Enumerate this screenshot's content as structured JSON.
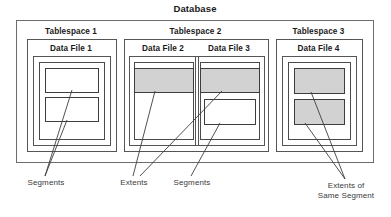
{
  "diagram": {
    "title": "Database",
    "tablespaces": [
      {
        "label": "Tablespace 1",
        "datafiles": [
          {
            "label": "Data File 1",
            "blocks": [
              {
                "fill": "white"
              },
              {
                "fill": "white"
              }
            ]
          }
        ]
      },
      {
        "label": "Tablespace 2",
        "datafiles": [
          {
            "label": "Data File 2",
            "blocks": [
              {
                "fill": "gray"
              }
            ]
          },
          {
            "label": "Data File 3",
            "blocks": [
              {
                "fill": "gray"
              },
              {
                "fill": "white"
              }
            ]
          }
        ]
      },
      {
        "label": "Tablespace 3",
        "datafiles": [
          {
            "label": "Data File 4",
            "blocks": [
              {
                "fill": "gray"
              },
              {
                "fill": "gray"
              }
            ]
          }
        ]
      }
    ],
    "callouts": [
      {
        "id": "segments-left",
        "line1": "Segments",
        "line2": ""
      },
      {
        "id": "extents",
        "line1": "Extents",
        "line2": ""
      },
      {
        "id": "segments-mid",
        "line1": "Segments",
        "line2": ""
      },
      {
        "id": "extents-same",
        "line1": "Extents of",
        "line2": "Same Segment"
      }
    ],
    "colors": {
      "block_gray": "#d2d2d2",
      "block_white": "#ffffff",
      "stroke": "#3d3d3d",
      "text": "#1a1a1a",
      "callout_text": "#3a3a3a"
    }
  }
}
